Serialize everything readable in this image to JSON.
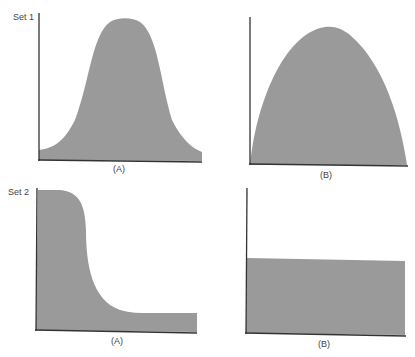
{
  "sets": [
    {
      "label": "Set 1",
      "panels": [
        {
          "label": "(A)",
          "shape": "bell-curve",
          "description": "bell-shaped distribution peaking at center"
        },
        {
          "label": "(B)",
          "shape": "parabola",
          "description": "inverted parabola spanning full axis"
        }
      ]
    },
    {
      "label": "Set 2",
      "panels": [
        {
          "label": "(A)",
          "shape": "reverse-sigmoid",
          "description": "high plateau dropping sharply to low plateau"
        },
        {
          "label": "(B)",
          "shape": "flat",
          "description": "constant uniform level"
        }
      ]
    }
  ],
  "colors": {
    "fill": "#9a9a9a",
    "axis": "#333333"
  }
}
